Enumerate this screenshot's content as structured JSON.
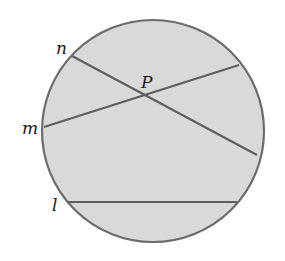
{
  "figure": {
    "circle": {
      "cx": 153,
      "cy": 131,
      "r": 111,
      "fill": "#d9d9d9",
      "stroke": "#6b6b6b"
    },
    "lines": [
      {
        "name": "n",
        "x1": 72,
        "y1": 56,
        "x2": 257,
        "y2": 155
      },
      {
        "name": "m",
        "x1": 44,
        "y1": 127,
        "x2": 239,
        "y2": 65
      },
      {
        "name": "l",
        "x1": 68,
        "y1": 202,
        "x2": 237,
        "y2": 202
      }
    ],
    "labels": {
      "n": "n",
      "m": "m",
      "l": "l",
      "P": "P"
    },
    "line_color": "#5e5e5e"
  }
}
